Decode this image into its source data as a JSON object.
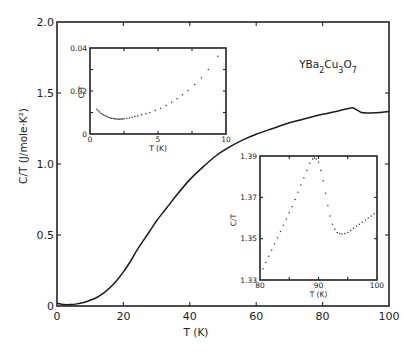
{
  "chart_data": [
    {
      "id": "main",
      "type": "line",
      "title": "",
      "annotation": "YBa2Cu3O7",
      "xlabel": "T (K)",
      "ylabel": "C/T (J/mole·K²)",
      "xlim": [
        0,
        100
      ],
      "ylim": [
        0,
        2.0
      ],
      "xticks": [
        0,
        20,
        40,
        60,
        80,
        100
      ],
      "yticks": [
        0,
        0.5,
        1.0,
        1.5,
        2.0
      ],
      "xtick_labels": [
        "0",
        "20",
        "40",
        "60",
        "80",
        "100"
      ],
      "ytick_labels": [
        "0",
        "0.5",
        "1.0",
        "1.5",
        "2.0"
      ],
      "grid": false,
      "series": [
        {
          "name": "C/T",
          "style": "solid",
          "x": [
            0,
            2,
            4,
            6,
            8,
            10,
            12,
            14,
            16,
            18,
            20,
            22,
            24,
            26,
            28,
            30,
            33,
            36,
            40,
            44,
            48,
            52,
            56,
            60,
            65,
            70,
            75,
            80,
            84,
            88.5,
            90,
            91.5,
            93,
            95,
            97,
            100
          ],
          "y": [
            0.02,
            0.01,
            0.01,
            0.015,
            0.025,
            0.04,
            0.06,
            0.09,
            0.13,
            0.18,
            0.24,
            0.31,
            0.39,
            0.46,
            0.53,
            0.6,
            0.69,
            0.78,
            0.89,
            0.98,
            1.06,
            1.12,
            1.17,
            1.21,
            1.25,
            1.29,
            1.32,
            1.35,
            1.37,
            1.395,
            1.385,
            1.365,
            1.36,
            1.36,
            1.362,
            1.37
          ]
        }
      ]
    },
    {
      "id": "inset-low-T",
      "type": "scatter",
      "xlabel": "T (K)",
      "ylabel": "C/T",
      "xlim": [
        0,
        10
      ],
      "ylim": [
        0,
        0.04
      ],
      "xticks": [
        0,
        5,
        10
      ],
      "yticks": [
        0,
        0.02,
        0.04
      ],
      "xtick_labels": [
        "0",
        "5",
        "10"
      ],
      "ytick_labels": [
        "0",
        "0.02",
        "0.04"
      ],
      "series": [
        {
          "name": "C/T",
          "x": [
            0.5,
            0.6,
            0.7,
            0.8,
            0.9,
            1.0,
            1.1,
            1.2,
            1.3,
            1.4,
            1.5,
            1.6,
            1.7,
            1.8,
            1.9,
            2.0,
            2.1,
            2.2,
            2.3,
            2.4,
            2.5,
            2.7,
            2.9,
            3.1,
            3.3,
            3.5,
            3.8,
            4.1,
            4.4,
            4.8,
            5.2,
            5.6,
            6.0,
            6.4,
            6.8,
            7.2,
            7.7,
            8.2,
            8.7,
            9.4
          ],
          "y": [
            0.0115,
            0.0108,
            0.0102,
            0.0097,
            0.0093,
            0.0089,
            0.0085,
            0.0082,
            0.0079,
            0.0077,
            0.0075,
            0.0073,
            0.0072,
            0.0071,
            0.007,
            0.007,
            0.0069,
            0.0069,
            0.007,
            0.007,
            0.0071,
            0.0073,
            0.0075,
            0.0078,
            0.0081,
            0.0084,
            0.0089,
            0.0094,
            0.01,
            0.0109,
            0.012,
            0.0133,
            0.0148,
            0.0164,
            0.0182,
            0.0202,
            0.023,
            0.0262,
            0.03,
            0.0362
          ]
        }
      ]
    },
    {
      "id": "inset-transition",
      "type": "scatter",
      "xlabel": "T (K)",
      "ylabel": "C/T",
      "xlim": [
        80,
        100
      ],
      "ylim": [
        1.33,
        1.39
      ],
      "xticks": [
        80,
        90,
        100
      ],
      "yticks": [
        1.33,
        1.35,
        1.37,
        1.39
      ],
      "xtick_labels": [
        "80",
        "90",
        "100"
      ],
      "ytick_labels": [
        "1.33",
        "1.35",
        "1.37",
        "1.39"
      ],
      "series": [
        {
          "name": "C/T",
          "x": [
            80.5,
            81.0,
            81.5,
            82.0,
            82.5,
            83.0,
            83.5,
            84.0,
            84.5,
            85.0,
            85.5,
            86.0,
            86.5,
            87.0,
            87.5,
            88.0,
            88.5,
            89.0,
            89.3,
            89.6,
            90.0,
            90.4,
            90.8,
            91.2,
            91.6,
            92.0,
            92.4,
            92.8,
            93.2,
            93.6,
            94.0,
            94.5,
            95.0,
            95.5,
            96.0,
            96.5,
            97.0,
            97.5,
            98.0,
            98.5,
            99.0,
            99.5,
            100.0
          ],
          "y": [
            1.3355,
            1.3385,
            1.3415,
            1.3445,
            1.3475,
            1.3505,
            1.3535,
            1.3565,
            1.3595,
            1.3625,
            1.3655,
            1.369,
            1.3725,
            1.376,
            1.3795,
            1.383,
            1.3865,
            1.3885,
            1.389,
            1.3885,
            1.387,
            1.383,
            1.378,
            1.372,
            1.366,
            1.361,
            1.357,
            1.3545,
            1.353,
            1.3525,
            1.3522,
            1.3525,
            1.353,
            1.354,
            1.355,
            1.356,
            1.357,
            1.358,
            1.359,
            1.36,
            1.361,
            1.362,
            1.363
          ]
        }
      ]
    }
  ]
}
